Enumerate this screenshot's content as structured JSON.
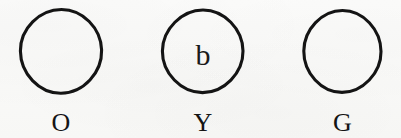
{
  "figure": {
    "background_color": "#fbfbfa",
    "ink_color": "#141414",
    "items": [
      {
        "id": "circle-o",
        "caption": "O",
        "inner_text": "",
        "has_inner_text": false,
        "left": 15,
        "top": 8,
        "width": 92,
        "height": 95,
        "caption_center_x": 62,
        "caption_baseline_y": 132,
        "caption_font_size": 26
      },
      {
        "id": "circle-y",
        "caption": "Y",
        "inner_text": "b",
        "has_inner_text": true,
        "left": 156,
        "top": 9,
        "width": 94,
        "height": 93,
        "inner_center_x": 204,
        "inner_baseline_y": 66,
        "inner_font_size": 30,
        "caption_center_x": 203,
        "caption_baseline_y": 132,
        "caption_font_size": 26
      },
      {
        "id": "circle-g",
        "caption": "G",
        "inner_text": "",
        "has_inner_text": false,
        "left": 298,
        "top": 10,
        "width": 89,
        "height": 92,
        "caption_center_x": 342,
        "caption_baseline_y": 132,
        "caption_font_size": 26
      }
    ]
  }
}
